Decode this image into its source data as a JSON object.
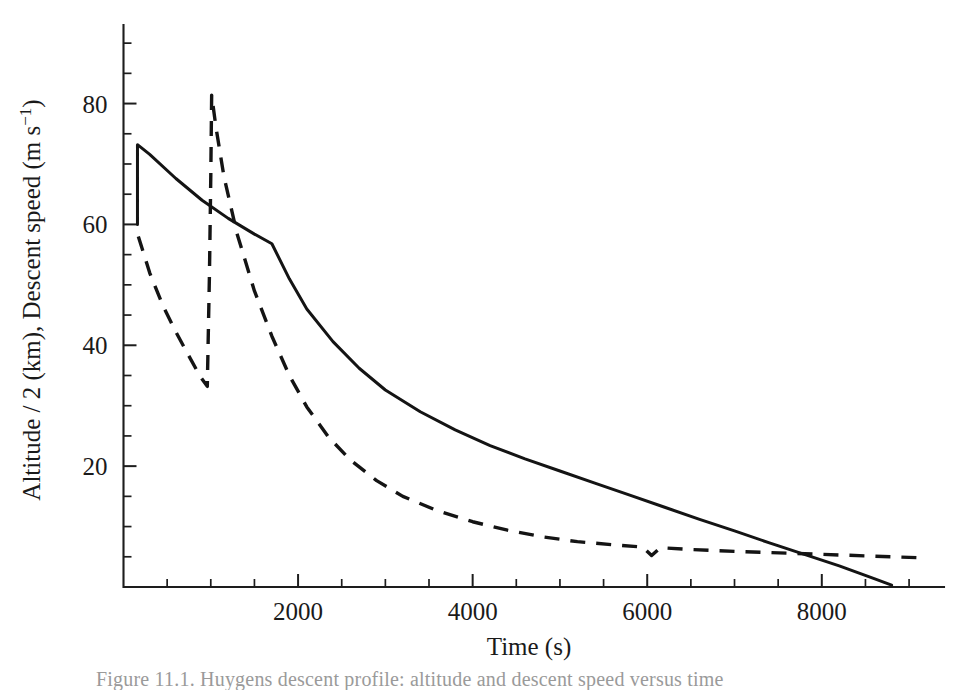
{
  "figure": {
    "caption_partial": "Figure 11.1.  Huygens descent profile: altitude and descent speed versus time"
  },
  "chart_data": {
    "type": "line",
    "title": "",
    "subtitle": "",
    "xlabel": "Time (s)",
    "ylabel": "Altitude / 2 (km),  Descent speed (m s",
    "ylabel_exponent": "−1",
    "ylabel_close": ")",
    "xlim": [
      0,
      9400
    ],
    "ylim": [
      0,
      93
    ],
    "grid": false,
    "legend_position": "none",
    "x_ticks_major": [
      2000,
      4000,
      6000,
      8000
    ],
    "x_tick_labels": [
      "2000",
      "4000",
      "6000",
      "8000"
    ],
    "x_ticks_minor": [
      500,
      1000,
      1500,
      2500,
      3000,
      3500,
      4500,
      5000,
      5500,
      6500,
      7000,
      7500,
      8500,
      9000
    ],
    "y_ticks_major": [
      20,
      40,
      60,
      80
    ],
    "y_tick_labels": [
      "20",
      "40",
      "60",
      "80"
    ],
    "y_ticks_minor": [
      5,
      10,
      15,
      25,
      30,
      35,
      45,
      50,
      55,
      65,
      70,
      75,
      85,
      90
    ],
    "series": [
      {
        "name": "Altitude / 2 (km)",
        "style": "solid",
        "points": [
          [
            160,
            60.0
          ],
          [
            160,
            73.2
          ],
          [
            300,
            71.6
          ],
          [
            600,
            67.6
          ],
          [
            900,
            64.0
          ],
          [
            1200,
            61.0
          ],
          [
            1500,
            58.4
          ],
          [
            1700,
            56.8
          ],
          [
            1900,
            51.0
          ],
          [
            2100,
            46.0
          ],
          [
            2400,
            40.6
          ],
          [
            2700,
            36.2
          ],
          [
            3000,
            32.6
          ],
          [
            3400,
            29.0
          ],
          [
            3800,
            26.0
          ],
          [
            4200,
            23.4
          ],
          [
            4600,
            21.2
          ],
          [
            5000,
            19.2
          ],
          [
            5400,
            17.2
          ],
          [
            5800,
            15.2
          ],
          [
            6200,
            13.2
          ],
          [
            6600,
            11.2
          ],
          [
            7000,
            9.3
          ],
          [
            7400,
            7.3
          ],
          [
            7800,
            5.4
          ],
          [
            8200,
            3.5
          ],
          [
            8600,
            1.4
          ],
          [
            8800,
            0.3
          ]
        ]
      },
      {
        "name": "Descent speed (m s−1)",
        "style": "dashed",
        "points": [
          [
            170,
            58.0
          ],
          [
            300,
            52.0
          ],
          [
            450,
            46.6
          ],
          [
            600,
            42.2
          ],
          [
            750,
            38.2
          ],
          [
            880,
            34.8
          ],
          [
            960,
            33.2
          ],
          [
            985,
            52.0
          ],
          [
            1000,
            68.0
          ],
          [
            1010,
            81.4
          ],
          [
            1060,
            76.0
          ],
          [
            1150,
            68.0
          ],
          [
            1300,
            58.5
          ],
          [
            1500,
            49.0
          ],
          [
            1700,
            41.5
          ],
          [
            1900,
            35.0
          ],
          [
            2100,
            29.8
          ],
          [
            2350,
            24.8
          ],
          [
            2600,
            21.0
          ],
          [
            2900,
            17.6
          ],
          [
            3200,
            15.0
          ],
          [
            3600,
            12.6
          ],
          [
            4000,
            10.8
          ],
          [
            4400,
            9.4
          ],
          [
            4800,
            8.3
          ],
          [
            5200,
            7.5
          ],
          [
            5600,
            7.0
          ],
          [
            5950,
            6.6
          ],
          [
            6050,
            5.2
          ],
          [
            6150,
            6.5
          ],
          [
            6500,
            6.2
          ],
          [
            7000,
            5.9
          ],
          [
            7600,
            5.6
          ],
          [
            8200,
            5.3
          ],
          [
            8800,
            5.0
          ],
          [
            9200,
            4.8
          ]
        ]
      }
    ]
  }
}
